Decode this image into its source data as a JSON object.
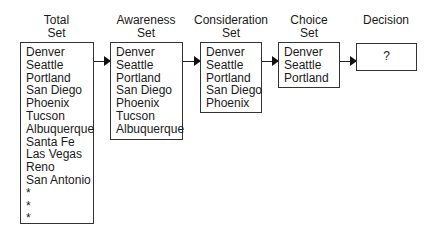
{
  "stages": [
    {
      "title_line1": "Total",
      "title_line2": "Set",
      "items": [
        "Denver",
        "Seattle",
        "Portland",
        "San Diego",
        "Phoenix",
        "Tucson",
        "Albuquerque",
        "Santa Fe",
        "Las Vegas",
        "Reno",
        "San Antonio",
        "*",
        "*",
        "*"
      ]
    },
    {
      "title_line1": "Awareness",
      "title_line2": "Set",
      "items": [
        "Denver",
        "Seattle",
        "Portland",
        "San Diego",
        "Phoenix",
        "Tucson",
        "Albuquerque"
      ]
    },
    {
      "title_line1": "Consideration",
      "title_line2": "Set",
      "items": [
        "Denver",
        "Seattle",
        "Portland",
        "San Diego",
        "Phoenix"
      ]
    },
    {
      "title_line1": "Choice",
      "title_line2": "Set",
      "items": [
        "Denver",
        "Seattle",
        "Portland"
      ]
    },
    {
      "title_line1": "Decision",
      "title_line2": "",
      "items": [
        "?"
      ]
    }
  ]
}
